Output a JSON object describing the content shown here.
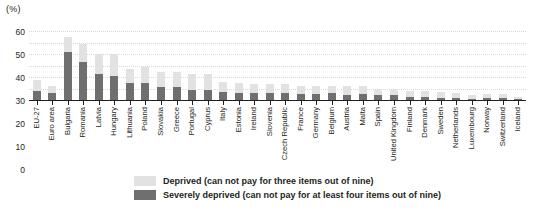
{
  "unit_label": "(%)",
  "legend": {
    "items": [
      {
        "key": "deprived",
        "label": "Deprived (can not pay for three items out of nine)",
        "color": "#e2e2e2"
      },
      {
        "key": "severely_deprived",
        "label": "Severely deprived (can not pay for at least four items out of nine)",
        "color": "#6f6f6f"
      }
    ]
  },
  "chart_data": {
    "type": "bar",
    "stacked": true,
    "title": "",
    "subtitle": "",
    "xlabel": "",
    "ylabel": "(%)",
    "ylim": [
      0,
      60
    ],
    "yticks": [
      0,
      10,
      20,
      30,
      40,
      50,
      60
    ],
    "grid": true,
    "legend_position": "bottom",
    "categories": [
      "EU-27",
      "Euro area",
      "Bulgaria",
      "Romania",
      "Latvia",
      "Hungary",
      "Lithuania",
      "Poland",
      "Slovakia",
      "Greece",
      "Portugal",
      "Cyprus",
      "Italy",
      "Estonia",
      "Ireland",
      "Slovenia",
      "Czech Republic",
      "France",
      "Germany",
      "Belgium",
      "Austria",
      "Malta",
      "Spain",
      "United Kingdom",
      "Finland",
      "Denmark",
      "Sweden",
      "Netherlands",
      "Luxembourg",
      "Norway",
      "Switzerland",
      "Iceland"
    ],
    "series": [
      {
        "name": "Severely deprived (can not pay for at least four items out of nine)",
        "color": "#6f6f6f",
        "values": [
          8,
          6,
          42,
          33,
          23,
          21,
          15,
          15,
          11,
          11,
          9,
          9,
          7,
          6,
          6,
          6,
          6,
          5,
          5,
          6,
          4,
          5,
          4,
          4,
          3,
          3,
          2,
          2,
          1,
          2,
          2,
          1
        ]
      },
      {
        "name": "Deprived (can not pay for three items out of nine)",
        "color": "#e2e2e2",
        "values": [
          9,
          6,
          13,
          16,
          17,
          19,
          12,
          14,
          13,
          13,
          14,
          14,
          9,
          9,
          8,
          8,
          8,
          7,
          7,
          6,
          8,
          7,
          6,
          6,
          5,
          5,
          5,
          4,
          3,
          3,
          3,
          2
        ]
      }
    ],
    "totals": [
      17,
      12,
      55,
      49,
      40,
      40,
      27,
      29,
      24,
      24,
      23,
      23,
      16,
      15,
      14,
      14,
      14,
      12,
      12,
      12,
      12,
      12,
      10,
      10,
      8,
      8,
      7,
      6,
      4,
      5,
      5,
      3
    ]
  }
}
